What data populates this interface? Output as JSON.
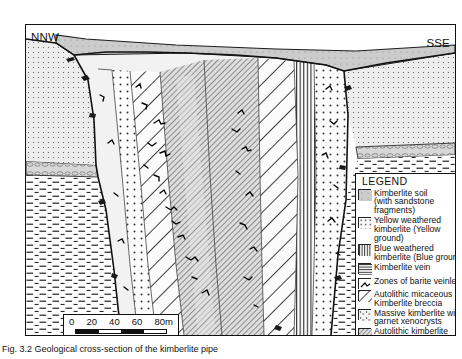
{
  "figure": {
    "direction_left": "NNW",
    "direction_right": "SSE",
    "caption": "Fig. 3.2  Geological cross-section of the kimberlite pipe"
  },
  "scale": {
    "ticks": [
      "0",
      "20",
      "40",
      "60",
      "80m"
    ],
    "unit": "m"
  },
  "legend": {
    "title": "LEGEND",
    "items": [
      {
        "pattern": "kimberlite-soil",
        "label": "Kimberlite soil\n(with sandstone fragments)"
      },
      {
        "pattern": "yellow-weathered-kimberlite",
        "label": "Yellow weathered\nkimberlite (Yellow ground)"
      },
      {
        "pattern": "blue-weathered-kimberlite",
        "label": "Blue weathered\nkimberlite (Blue ground)"
      },
      {
        "pattern": "kimberlite-vein",
        "label": "Kimberlite vein"
      },
      {
        "pattern": "barite-veinlets",
        "label": "Zones of barite veinlets"
      },
      {
        "pattern": "autolithic-micaceous-breccia",
        "label": "Autolithic micaceous\nKimberlite breccia"
      },
      {
        "pattern": "massive-kimberlite-garnet",
        "label": "Massive kimberlite with\ngarnet xenocrysts"
      },
      {
        "pattern": "autolithic-kimberlite-breccia",
        "label": "Autolithic kimberlite\nbreccia"
      },
      {
        "pattern": "baghain-sandstone",
        "label": "Baghain Sandstone"
      },
      {
        "pattern": "pipartola-conglomerate",
        "label": "Pipartola Conglomerate"
      },
      {
        "pattern": "palkawan-shale",
        "label": "Palkawan Shale"
      },
      {
        "pattern": "country-rock-xenoliths",
        "label": "Country rock xenoliths"
      }
    ]
  },
  "colors": {
    "ink": "#111111",
    "soil_grey": "#c9c9c9",
    "sandstone_grey": "#e9e9e9",
    "conglomerate_grey": "#d3d3d3",
    "breccia_grey": "#dcdcdc"
  }
}
